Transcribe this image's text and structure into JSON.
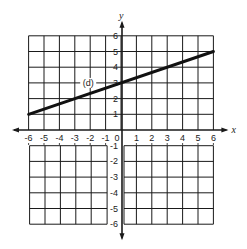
{
  "chart_data": {
    "type": "line",
    "title": "",
    "xlabel": "x",
    "ylabel": "y",
    "xlim": [
      -6,
      6
    ],
    "ylim": [
      -6,
      6
    ],
    "grid": true,
    "x_ticks": [
      -6,
      -5,
      -4,
      -3,
      -2,
      -1,
      0,
      1,
      2,
      3,
      4,
      5,
      6
    ],
    "y_ticks": [
      -6,
      -5,
      -4,
      -3,
      -2,
      -1,
      1,
      2,
      3,
      4,
      5,
      6
    ],
    "x_tick_labels": [
      "-6",
      "-5",
      "-4",
      "-3",
      "-2",
      "-1",
      "0",
      "1",
      "2",
      "3",
      "4",
      "5",
      "6"
    ],
    "y_tick_labels": [
      "-6",
      "-5",
      "-4",
      "-3",
      "-2",
      "-1",
      "1",
      "2",
      "3",
      "4",
      "5",
      "6"
    ],
    "series": [
      {
        "name": "(d)",
        "x": [
          -6,
          6
        ],
        "y": [
          1,
          5
        ],
        "equation": "y = (1/3)x + 3"
      }
    ],
    "annotations": [
      {
        "text": "(d)",
        "x": -2,
        "y": 3
      }
    ],
    "legend": null
  },
  "labels": {
    "x_axis": "x",
    "y_axis": "y",
    "line_label": "(d)"
  },
  "colors": {
    "ink": "#1a1a1a",
    "background": "#ffffff"
  }
}
